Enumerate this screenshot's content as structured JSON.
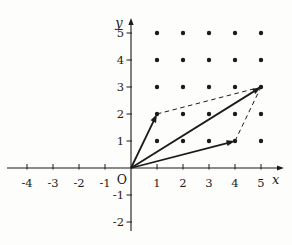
{
  "figure": {
    "background_color": "#fdfdfc",
    "ink_color": "#1b1b1b",
    "axes": {
      "x_label": "x",
      "y_label": "y",
      "origin_label": "O",
      "x_ticks": [
        -4,
        -3,
        -2,
        -1,
        1,
        2,
        3,
        4,
        5
      ],
      "y_ticks": [
        -2,
        -1,
        1,
        2,
        3,
        4,
        5
      ],
      "x_range": [
        -4.8,
        5.9
      ],
      "y_range": [
        -2.4,
        5.6
      ]
    },
    "lattice_grid": {
      "x_values": [
        1,
        2,
        3,
        4,
        5
      ],
      "y_values": [
        1,
        2,
        3,
        4,
        5
      ]
    },
    "vectors": [
      {
        "name": "vector-to-1-2",
        "from": [
          0,
          0
        ],
        "to": [
          1,
          2
        ]
      },
      {
        "name": "vector-to-4-1",
        "from": [
          0,
          0
        ],
        "to": [
          4,
          1
        ]
      },
      {
        "name": "vector-sum-to-5-3",
        "from": [
          0,
          0
        ],
        "to": [
          5,
          3
        ]
      }
    ],
    "dashed_edges": [
      {
        "name": "parallelogram-edge-top",
        "from": [
          1,
          2
        ],
        "to": [
          5,
          3
        ]
      },
      {
        "name": "parallelogram-edge-right",
        "from": [
          4,
          1
        ],
        "to": [
          5,
          3
        ]
      }
    ]
  }
}
